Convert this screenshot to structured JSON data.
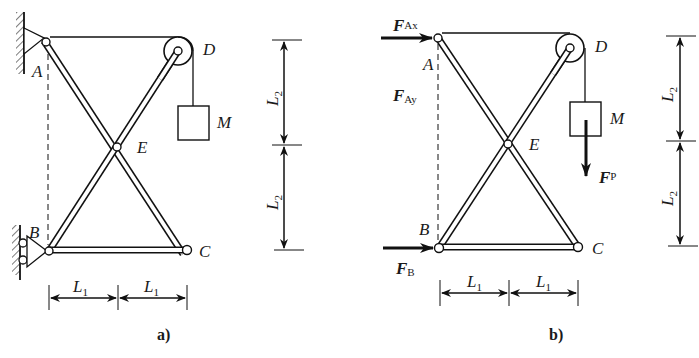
{
  "figure": {
    "panels": [
      {
        "id": "a",
        "caption": "a)",
        "points": {
          "A": "A",
          "B": "B",
          "C": "C",
          "D": "D",
          "E": "E"
        },
        "mass_label": "M",
        "dims": {
          "L2_top": "L",
          "L2_top_sub": "2",
          "L2_bottom": "L",
          "L2_bottom_sub": "2",
          "L1_left": "L",
          "L1_left_sub": "1",
          "L1_right": "L",
          "L1_right_sub": "1"
        }
      },
      {
        "id": "b",
        "caption": "b)",
        "points": {
          "A": "A",
          "B": "B",
          "C": "C",
          "D": "D",
          "E": "E"
        },
        "mass_label": "M",
        "forces": {
          "FAx": {
            "main": "F",
            "sub": "Ax"
          },
          "FAy": {
            "main": "F",
            "sub": "Ay"
          },
          "FB": {
            "main": "F",
            "sub": "B"
          },
          "FP": {
            "main": "F",
            "sub": "P"
          }
        },
        "dims": {
          "L2_top": "L",
          "L2_top_sub": "2",
          "L2_bottom": "L",
          "L2_bottom_sub": "2",
          "L1_left": "L",
          "L1_left_sub": "1",
          "L1_right": "L",
          "L1_right_sub": "1"
        }
      }
    ]
  }
}
